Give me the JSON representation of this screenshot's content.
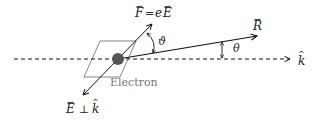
{
  "diagram": {
    "type": "physics-vector-diagram",
    "labels": {
      "force": "F = eE",
      "field": "E ⊥ k",
      "position": "R",
      "direction": "k",
      "electron": "Electron",
      "angle_force": "ϑ",
      "angle_elevation": "θ"
    },
    "colors": {
      "lines": "#111111",
      "electron": "#555555",
      "plane": "#666666",
      "electron_label": "#777777"
    }
  }
}
